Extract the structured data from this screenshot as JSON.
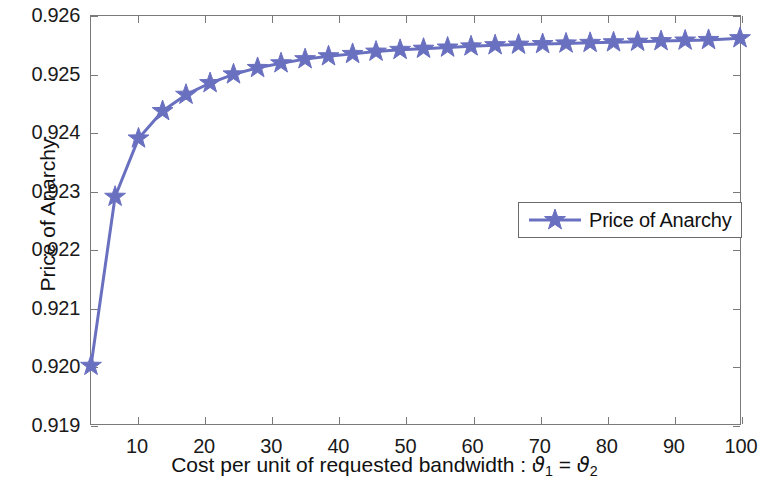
{
  "chart_data": {
    "type": "line",
    "title": "",
    "xlabel": "Cost per unit of requested bandwidth : ϑ₁ = ϑ₂",
    "ylabel": "Price of Anarchy",
    "xlim": [
      3.0,
      100.0
    ],
    "ylim": [
      0.919,
      0.926
    ],
    "grid": false,
    "legend_position": "upper-right",
    "marker": "star",
    "series": [
      {
        "name": "Price of Anarchy",
        "color": "#6a70c0",
        "x": [
          3.0,
          6.6,
          10.1,
          13.7,
          17.2,
          20.8,
          24.3,
          27.9,
          31.4,
          35.0,
          38.5,
          42.1,
          45.6,
          49.2,
          52.7,
          56.3,
          59.8,
          63.4,
          66.9,
          70.5,
          74.0,
          77.6,
          81.1,
          84.7,
          88.2,
          91.8,
          95.3,
          100.0
        ],
        "values": [
          0.92,
          0.9229,
          0.9239,
          0.92437,
          0.92465,
          0.92485,
          0.925,
          0.92511,
          0.92519,
          0.92526,
          0.92531,
          0.92535,
          0.92539,
          0.92542,
          0.92544,
          0.92546,
          0.92548,
          0.9255,
          0.92551,
          0.92552,
          0.92553,
          0.92554,
          0.92555,
          0.92556,
          0.92557,
          0.92558,
          0.92559,
          0.92562
        ]
      }
    ],
    "x_ticks": [
      10,
      20,
      30,
      40,
      50,
      60,
      70,
      80,
      90,
      100
    ],
    "x_tick_labels": [
      "10",
      "20",
      "30",
      "40",
      "50",
      "60",
      "70",
      "80",
      "90",
      "100"
    ],
    "y_ticks": [
      0.919,
      0.92,
      0.921,
      0.922,
      0.923,
      0.924,
      0.925,
      0.926
    ],
    "y_tick_labels": [
      "0.919",
      "0.920",
      "0.921",
      "0.922",
      "0.923",
      "0.924",
      "0.925",
      "0.926"
    ],
    "xlabel_parts": {
      "prefix": "Cost per unit of requested bandwidth : ",
      "symbol1": "ϑ",
      "subscript1": "1",
      "equals": " = ",
      "symbol2": "ϑ",
      "subscript2": "2"
    }
  },
  "legend": {
    "entries": [
      {
        "label": "Price of Anarchy",
        "color": "#6a70c0",
        "marker": "star"
      }
    ]
  },
  "colors": {
    "series": "#6a70c0",
    "axis": "#7a7a7a",
    "text": "#111111",
    "background": "#ffffff"
  }
}
